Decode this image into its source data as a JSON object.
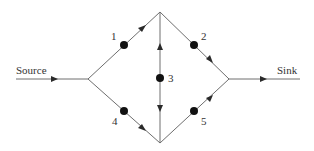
{
  "diagram": {
    "type": "flow-network",
    "terminals": {
      "source": {
        "label": "Source"
      },
      "sink": {
        "label": "Sink"
      }
    },
    "nodes": [
      {
        "id": "1",
        "label": "1"
      },
      {
        "id": "2",
        "label": "2"
      },
      {
        "id": "3",
        "label": "3"
      },
      {
        "id": "4",
        "label": "4"
      },
      {
        "id": "5",
        "label": "5"
      }
    ],
    "edges": [
      {
        "from": "Source",
        "to": "left-junction",
        "direction": "forward"
      },
      {
        "from": "left-junction",
        "to": "top-vertex",
        "via": "1",
        "direction": "forward"
      },
      {
        "from": "left-junction",
        "to": "bottom-vertex",
        "via": "4",
        "direction": "forward"
      },
      {
        "from": "top-vertex",
        "to": "right-junction",
        "via": "2",
        "direction": "forward"
      },
      {
        "from": "bottom-vertex",
        "to": "right-junction",
        "via": "5",
        "direction": "forward"
      },
      {
        "from": "top-vertex",
        "to": "bottom-vertex",
        "via": "3",
        "direction": "bidirectional"
      },
      {
        "from": "right-junction",
        "to": "Sink",
        "direction": "forward"
      }
    ],
    "colors": {
      "line": "#6e6e6e",
      "node": "#111111",
      "text": "#333333"
    }
  }
}
